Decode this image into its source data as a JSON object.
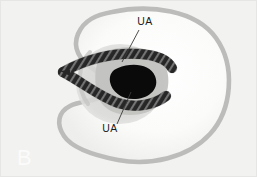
{
  "figure": {
    "panel_label": "B",
    "modality": "ultrasound-line-drawing",
    "background_color": "#f2f2f0",
    "frame_color": "#e8e8e6"
  },
  "annotations": [
    {
      "id": "ua-upper",
      "label": "UA",
      "label_x": 145,
      "label_y": 25,
      "leader": {
        "x1": 139,
        "y1": 30,
        "x2": 122,
        "y2": 62
      }
    },
    {
      "id": "ua-lower",
      "label": "UA",
      "label_x": 110,
      "label_y": 132,
      "leader": {
        "x1": 117,
        "y1": 124,
        "x2": 131,
        "y2": 92
      }
    }
  ],
  "structures": {
    "uterine_outline": {
      "name": "uterine-wall-outline",
      "stroke_color": "#b9b9b7",
      "fill_color": "#fcfcfb",
      "stroke_width": 4.5
    },
    "cervix_region": {
      "name": "cervical-soft-tissue",
      "fill_color": "#c2c2c0"
    },
    "inner_halo": {
      "name": "lower-segment-halo",
      "fill_color": "#d6d6d4"
    },
    "vessel_lumen": {
      "name": "vessel-lumen",
      "fill_color": "#0a0a0a"
    },
    "umbilical_arteries": {
      "name": "umbilical-artery-bands",
      "stroke_color": "#2a2a2a",
      "hatch_color": "#8e8e8e",
      "band_width": 9
    }
  },
  "colors": {
    "ink": "#1b1b1b",
    "panel_letter": "#fbfbfb",
    "leader_line": "#3a3a3a"
  }
}
